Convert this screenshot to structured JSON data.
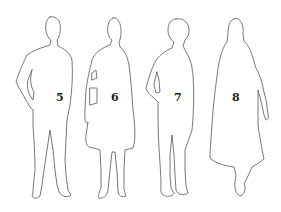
{
  "figures": [
    {
      "label": "5",
      "description": "male figure, hand on hip"
    },
    {
      "label": "6",
      "description": "female figure in coat with handbag"
    },
    {
      "label": "7",
      "description": "male figure, side view"
    },
    {
      "label": "8",
      "description": "female figure in long dress, walking"
    }
  ],
  "colors": {
    "outline": "#555555",
    "background": "#ffffff",
    "label": "#222222"
  }
}
